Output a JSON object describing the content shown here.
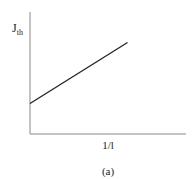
{
  "chart_data": {
    "type": "line",
    "title": "",
    "caption": "(a)",
    "xlabel": "1/l",
    "ylabel": "J",
    "ylabel_subscript": "th",
    "grid": false,
    "legend": null,
    "ticks": false,
    "series": [
      {
        "name": "J_th vs 1/l",
        "x": [
          0,
          1
        ],
        "y": [
          0.25,
          0.75
        ],
        "color": "#222222"
      }
    ],
    "xlim": [
      0,
      1.6
    ],
    "ylim": [
      0,
      1.0
    ]
  },
  "labels": {
    "y_main": "J",
    "y_sub": "th",
    "x": "1/l",
    "caption": "(a)"
  }
}
